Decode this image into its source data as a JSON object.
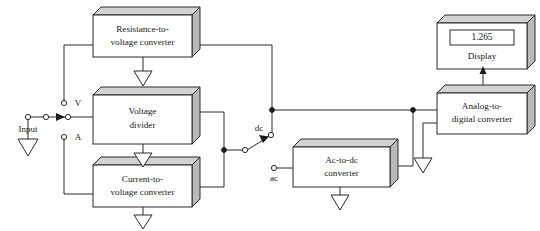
{
  "diagram": {
    "colors": {
      "line": "#2a2a2a",
      "box_front": "#ffffff",
      "box_top": "#d2d2d2",
      "box_side": "#b9b9b9",
      "text": "#1a1a1a"
    },
    "blocks": [
      {
        "id": "resistance-to-voltage-converter",
        "line1": "Resistance-to-",
        "line2": "voltage converter"
      },
      {
        "id": "voltage-divider",
        "line1": "Voltage",
        "line2": "divider"
      },
      {
        "id": "current-to-voltage-converter",
        "line1": "Current-to-",
        "line2": "voltage converter"
      },
      {
        "id": "ac-to-dc-converter",
        "line1": "Ac-to-dc",
        "line2": "converter"
      },
      {
        "id": "analog-to-digital-converter",
        "line1": "Analog-to-",
        "line2": "digital converter"
      },
      {
        "id": "display",
        "line1": "",
        "line2": "Display"
      }
    ],
    "display": {
      "reading": "1.265",
      "label": "Display"
    },
    "labels": {
      "input": "Input",
      "terminal_v": "V",
      "terminal_a": "A",
      "switch_dc": "dc",
      "switch_ac": "ac"
    }
  }
}
